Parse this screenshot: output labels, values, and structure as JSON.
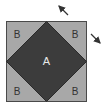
{
  "diagram": {
    "labels": {
      "center": "A",
      "top_left": "B",
      "top_right": "B",
      "bottom_left": "B",
      "bottom_right": "B"
    },
    "colors": {
      "outer_square": "#a8a8a8",
      "diamond": "#3c3c3c",
      "border": "#4a4a4a",
      "label_on_light": "#333333",
      "label_on_dark": "#e8e8e8",
      "arrow": "#333333"
    },
    "arrows": [
      {
        "name": "arrow-up-left",
        "direction": "up-left"
      },
      {
        "name": "arrow-down-right",
        "direction": "down-right"
      }
    ]
  }
}
